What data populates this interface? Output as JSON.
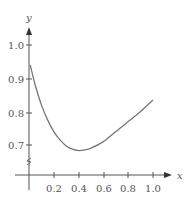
{
  "chart_data": {
    "type": "line",
    "title": "",
    "xlabel": "x",
    "ylabel": "y",
    "x_ticks": [
      "0.2",
      "0.4",
      "0.6",
      "0.8",
      "1.0"
    ],
    "y_ticks": [
      "0.7",
      "0.8",
      "0.9",
      "1.0"
    ],
    "xlim": [
      0,
      1.0
    ],
    "ylim": [
      0.65,
      1.05
    ],
    "grid": false,
    "y_axis_break": true,
    "series": [
      {
        "name": "curve",
        "color": "#777777",
        "x": [
          0.01,
          0.05,
          0.1,
          0.15,
          0.2,
          0.25,
          0.3,
          0.35,
          0.4,
          0.45,
          0.5,
          0.6,
          0.7,
          0.8,
          0.9,
          1.0
        ],
        "y": [
          0.94,
          0.88,
          0.82,
          0.775,
          0.74,
          0.715,
          0.697,
          0.687,
          0.683,
          0.685,
          0.69,
          0.71,
          0.74,
          0.77,
          0.8,
          0.835
        ]
      }
    ]
  },
  "axes": {
    "x_label": "x",
    "y_label": "y",
    "x_tick_labels": [
      "0.2",
      "0.4",
      "0.6",
      "0.8",
      "1.0"
    ],
    "y_tick_labels": [
      "1.0",
      "0.9",
      "0.8",
      "0.7"
    ]
  },
  "colors": {
    "axis": "#555555",
    "curve": "#777777"
  }
}
